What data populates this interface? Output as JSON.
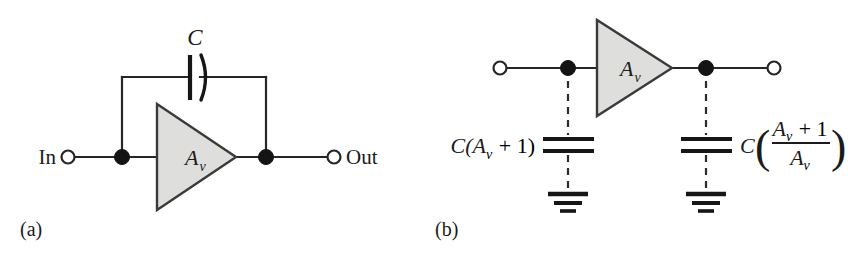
{
  "figure": {
    "background_color": "#ffffff",
    "ink_color": "#1b1b1b",
    "amp_fill_color": "#dededd",
    "panels": [
      {
        "id": "panel-a",
        "caption": "(a)",
        "description": "Miller effect: amplifier with feedback capacitor C between input and output",
        "input_label": "In",
        "output_label": "Out",
        "amp_gain_label": "A",
        "amp_gain_subscript": "v",
        "cap_label": "C"
      },
      {
        "id": "panel-b",
        "caption": "(b)",
        "description": "Miller equivalent: input capacitance C(Av+1) to ground and output capacitance C((Av+1)/Av) to ground",
        "amp_gain_label": "A",
        "amp_gain_subscript": "v",
        "left_cap_label": "C(A",
        "left_cap_sub": "v",
        "left_cap_tail": " + 1)",
        "right_cap_lead": "C",
        "right_cap_num_a": "A",
        "right_cap_num_sub": "v",
        "right_cap_num_tail": " + 1",
        "right_cap_den_a": "A",
        "right_cap_den_sub": "v"
      }
    ]
  }
}
